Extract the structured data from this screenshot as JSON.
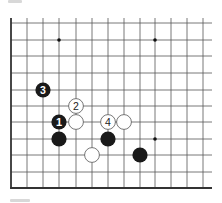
{
  "board": {
    "line_color": "#555555",
    "edge_color": "#333333",
    "columns_x": [
      11,
      27,
      43,
      59,
      76,
      92,
      108,
      124,
      140,
      155,
      171,
      187,
      203
    ],
    "rows_y": [
      23,
      40,
      56,
      73,
      90,
      106,
      122,
      139,
      155,
      172,
      188
    ],
    "right_extent": 212,
    "top_extent": 18,
    "edges": [
      "left",
      "bottom"
    ],
    "star_points": [
      {
        "col": 3,
        "row": 1
      },
      {
        "col": 9,
        "row": 1
      },
      {
        "col": 9,
        "row": 7
      }
    ]
  },
  "stones": [
    {
      "color": "black",
      "col": 2,
      "row": 4,
      "label": "3"
    },
    {
      "color": "white",
      "col": 4,
      "row": 5,
      "label": "2"
    },
    {
      "color": "black",
      "col": 3,
      "row": 6,
      "label": "1"
    },
    {
      "color": "white",
      "col": 4,
      "row": 6,
      "label": ""
    },
    {
      "color": "white",
      "col": 6,
      "row": 6,
      "label": "4"
    },
    {
      "color": "white",
      "col": 7,
      "row": 6,
      "label": ""
    },
    {
      "color": "black",
      "col": 3,
      "row": 7,
      "label": ""
    },
    {
      "color": "black",
      "col": 6,
      "row": 7,
      "label": ""
    },
    {
      "color": "white",
      "col": 5,
      "row": 8,
      "label": ""
    },
    {
      "color": "black",
      "col": 8,
      "row": 8,
      "label": ""
    }
  ],
  "colors": {
    "black_stone": "#1a1a1a",
    "white_stone": "#ffffff",
    "white_stone_border": "#555555"
  }
}
